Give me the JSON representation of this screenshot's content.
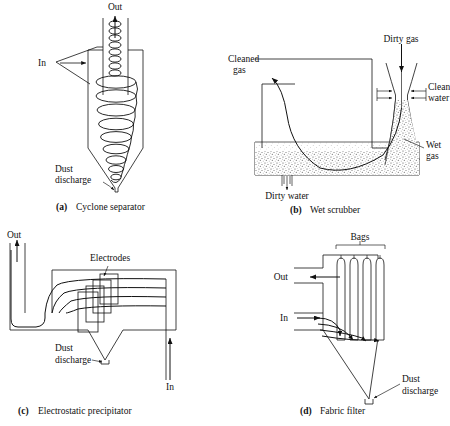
{
  "figure": {
    "title_present": false,
    "panel_count": 4,
    "line_color": "#111111",
    "background": "#ffffff",
    "stipple_color": "#6b6b6b"
  },
  "panels": [
    {
      "id": "a",
      "letter": "(a)",
      "caption": "Cyclone separator",
      "labels": {
        "out": "Out",
        "in": "In",
        "dust_discharge": "Dust\ndischarge",
        "dust_discharge_line1": "Dust",
        "dust_discharge_line2": "discharge"
      }
    },
    {
      "id": "b",
      "letter": "(b)",
      "caption": "Wet scrubber",
      "labels": {
        "cleaned_gas_line1": "Cleaned",
        "cleaned_gas_line2": "gas",
        "dirty_gas": "Dirty gas",
        "clean_water_line1": "Clean",
        "clean_water_line2": "water",
        "wet_gas_line1": "Wet",
        "wet_gas_line2": "gas",
        "dirty_water": "Dirty water"
      }
    },
    {
      "id": "c",
      "letter": "(c)",
      "caption": "Electrostatic precipitator",
      "labels": {
        "out": "Out",
        "in": "In",
        "electrodes": "Electrodes",
        "dust_discharge_line1": "Dust",
        "dust_discharge_line2": "discharge"
      }
    },
    {
      "id": "d",
      "letter": "(d)",
      "caption": "Fabric filter",
      "labels": {
        "out": "Out",
        "in": "In",
        "bags": "Bags",
        "dust_discharge_line1": "Dust",
        "dust_discharge_line2": "discharge"
      }
    }
  ]
}
